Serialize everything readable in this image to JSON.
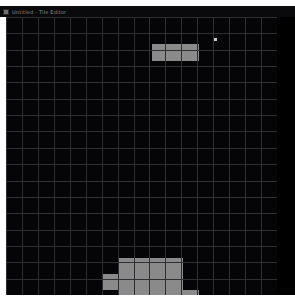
{
  "window": {
    "title": "Untitled - Tile Editor",
    "icon": "app-icon",
    "background_color": "#000000"
  },
  "grid": {
    "columns": 17,
    "rows": 17,
    "cell_size_px": 16,
    "line_color": "#2f2f33",
    "cell_color": "#050507",
    "origin_x": 6,
    "origin_y": 17,
    "width_px": 271,
    "height_px": 278
  },
  "selection": {
    "fill_color": "#8a8a8a",
    "shadow_color": "#6f6f6f",
    "marker_color": "#c8c8c8"
  },
  "regions": [
    {
      "name": "upper-bar",
      "x": 146,
      "y": 27,
      "width": 47,
      "height": 17,
      "tone": "light"
    },
    {
      "name": "lower-cluster-top",
      "x": 113,
      "y": 241,
      "width": 64,
      "height": 16,
      "tone": "light"
    },
    {
      "name": "lower-cluster-mid-left",
      "x": 97,
      "y": 257,
      "width": 80,
      "height": 16,
      "tone": "light"
    },
    {
      "name": "lower-cluster-bottom",
      "x": 113,
      "y": 273,
      "width": 64,
      "height": 16,
      "tone": "light"
    },
    {
      "name": "lower-cluster-bottom-right",
      "x": 177,
      "y": 273,
      "width": 16,
      "height": 16,
      "tone": "light"
    }
  ],
  "markers": [
    {
      "name": "pixel-marker-1",
      "x": 208,
      "y": 21,
      "size": 3
    }
  ]
}
